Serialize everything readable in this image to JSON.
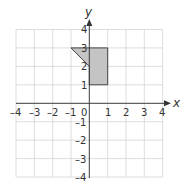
{
  "diagram": {
    "type": "coordinate-grid",
    "x_axis": {
      "label": "x",
      "ticks": [
        "–4",
        "–3",
        "–2",
        "–1",
        "0",
        "1",
        "2",
        "3",
        "4"
      ],
      "range": [
        -4,
        4
      ]
    },
    "y_axis": {
      "label": "y",
      "ticks": [
        "4",
        "3",
        "2",
        "1",
        "–1",
        "–2",
        "–3",
        "–4"
      ],
      "range": [
        -4,
        4
      ]
    },
    "shape": {
      "vertices": [
        [
          -1,
          3
        ],
        [
          1,
          3
        ],
        [
          1,
          1
        ],
        [
          0,
          1
        ],
        [
          0,
          2
        ]
      ],
      "fill": "#c4c4c4",
      "stroke": "#333333"
    },
    "grid_color": "#d4d4d4",
    "axis_color": "#3a3a3a"
  }
}
